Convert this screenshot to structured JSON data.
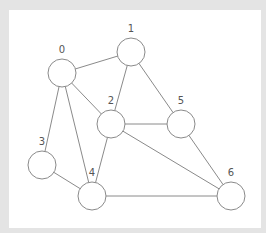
{
  "diagram": {
    "type": "undirected-graph",
    "colors": {
      "background": "#e4e4e4",
      "panel": "#ffffff",
      "stroke": "#8a8a8a",
      "label": "#555555"
    },
    "node_radius": 14,
    "nodes": [
      {
        "id": 0,
        "label": "0",
        "x": 62,
        "y": 73
      },
      {
        "id": 1,
        "label": "1",
        "x": 131,
        "y": 52
      },
      {
        "id": 2,
        "label": "2",
        "x": 111,
        "y": 124
      },
      {
        "id": 3,
        "label": "3",
        "x": 42,
        "y": 165
      },
      {
        "id": 4,
        "label": "4",
        "x": 92,
        "y": 196
      },
      {
        "id": 5,
        "label": "5",
        "x": 181,
        "y": 124
      },
      {
        "id": 6,
        "label": "6",
        "x": 231,
        "y": 196
      }
    ],
    "edges": [
      [
        0,
        1
      ],
      [
        0,
        2
      ],
      [
        0,
        3
      ],
      [
        0,
        4
      ],
      [
        1,
        2
      ],
      [
        1,
        5
      ],
      [
        2,
        4
      ],
      [
        2,
        5
      ],
      [
        2,
        6
      ],
      [
        3,
        4
      ],
      [
        4,
        6
      ],
      [
        5,
        6
      ]
    ]
  }
}
